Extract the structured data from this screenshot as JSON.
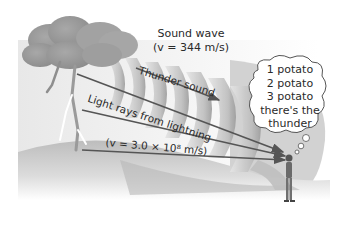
{
  "figure": {
    "sound_wave": {
      "title": "Sound wave",
      "speed": "(v = 344 m/s)"
    },
    "thunder_label": "Thunder sound",
    "light": {
      "label": "Light rays from lightning",
      "speed": "(v = 3.0 × 10⁸ m/s)"
    },
    "thought_bubble": {
      "lines": [
        "1 potato",
        "2 potato",
        "3 potato",
        "there's the",
        "thunder"
      ]
    }
  },
  "colors": {
    "cloud": "#9a9a9a",
    "ground": "#c8c8c8",
    "wavefront": "#b5b5b5",
    "arrow": "#555555",
    "text": "#2a2a2a"
  }
}
